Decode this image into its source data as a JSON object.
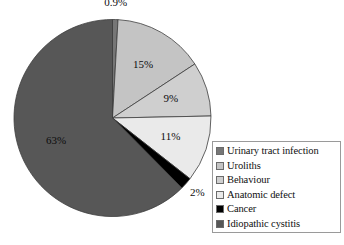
{
  "chart_data": {
    "type": "pie",
    "title": "",
    "subtitle": "",
    "xlabel": "",
    "ylabel": "",
    "grid": false,
    "legend_position": "right-bottom",
    "start_angle_deg": 0,
    "direction": "clockwise",
    "categories": [
      "Urinary tract infection",
      "Uroliths",
      "Behaviour",
      "Anatomic defect",
      "Cancer",
      "Idiopathic cystitis"
    ],
    "values": [
      0.9,
      15,
      9,
      11,
      2,
      63
    ],
    "data_labels": [
      "0.9%",
      "15%",
      "9%",
      "11%",
      "2%",
      "63%"
    ],
    "colors": [
      "#767676",
      "#c4c4c4",
      "#cfcfcf",
      "#eaeaea",
      "#000000",
      "#575757"
    ],
    "slices": [
      {
        "label": "Urinary tract infection",
        "value": 0.9,
        "data_label": "0.9%",
        "color": "#767676",
        "label_placement": "outside-top"
      },
      {
        "label": "Uroliths",
        "value": 15,
        "data_label": "15%",
        "color": "#c4c4c4",
        "label_placement": "inside"
      },
      {
        "label": "Behaviour",
        "value": 9,
        "data_label": "9%",
        "color": "#cfcfcf",
        "label_placement": "inside"
      },
      {
        "label": "Anatomic defect",
        "value": 11,
        "data_label": "11%",
        "color": "#eaeaea",
        "label_placement": "inside"
      },
      {
        "label": "Cancer",
        "value": 2,
        "data_label": "2%",
        "color": "#000000",
        "label_placement": "outside-bottom-right"
      },
      {
        "label": "Idiopathic cystitis",
        "value": 63,
        "data_label": "63%",
        "color": "#575757",
        "label_placement": "inside"
      }
    ]
  },
  "legend": {
    "items": [
      {
        "label": "Urinary tract infection",
        "color": "#767676"
      },
      {
        "label": "Uroliths",
        "color": "#c4c4c4"
      },
      {
        "label": "Behaviour",
        "color": "#cfcfcf"
      },
      {
        "label": "Anatomic defect",
        "color": "#eaeaea"
      },
      {
        "label": "Cancer",
        "color": "#000000"
      },
      {
        "label": "Idiopathic cystitis",
        "color": "#575757"
      }
    ]
  }
}
